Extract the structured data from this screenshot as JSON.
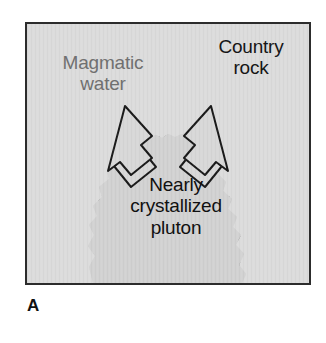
{
  "figure": {
    "caption_letter": "A",
    "panel": {
      "background_label": "country-rock-background",
      "colors": {
        "frame_border": "#2c2c2c",
        "country_rock_fill": "#dcdcdc",
        "pluton_fill": "#d2d2d2",
        "pluton_outline": "#1a1a1a",
        "crystal_mark": "#6e6e6e",
        "arrow_fill": "#d8d8d8",
        "arrow_outline": "#1a1a1a",
        "magmatic_text": "#707070",
        "country_text": "#161616",
        "pluton_text": "#101010"
      }
    },
    "labels": {
      "magmatic_water": "Magmatic\nwater",
      "country_rock": "Country\nrock",
      "nearly_crystallized_pluton": "Nearly\ncrystallized\npluton"
    },
    "arrows": {
      "left": "magmatic-water-arrow-left",
      "right": "magmatic-water-arrow-right",
      "count": 2,
      "direction": "upward-outward"
    }
  }
}
